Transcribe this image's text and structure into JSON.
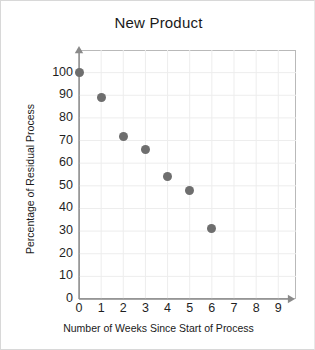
{
  "page": {
    "background_color": "#ffffff",
    "border_color": "#d8d8d8"
  },
  "chart_data": {
    "type": "scatter",
    "title": "New Product",
    "xlabel": "Number of Weeks Since Start of Process",
    "ylabel": "Percentage of Residual Process",
    "xlim": [
      0,
      9.8
    ],
    "ylim": [
      0,
      110
    ],
    "grid": true,
    "legend": null,
    "marker_color": "#6e6e6e",
    "marker_size_px": 9,
    "xticks": [
      0,
      1,
      2,
      3,
      4,
      5,
      6,
      7,
      8,
      9
    ],
    "xtick_labels": [
      "0",
      "1",
      "2",
      "3",
      "4",
      "5",
      "6",
      "7",
      "8",
      "9"
    ],
    "yticks": [
      0,
      10,
      20,
      30,
      40,
      50,
      60,
      70,
      80,
      90,
      100
    ],
    "ytick_labels": [
      "0",
      "10",
      "20",
      "30",
      "40",
      "50",
      "60",
      "70",
      "80",
      "90",
      "100"
    ],
    "x": [
      0,
      1,
      2,
      3,
      4,
      5,
      6
    ],
    "y": [
      100,
      89,
      72,
      66,
      54,
      48,
      31
    ],
    "points": [
      {
        "x": 0,
        "y": 100
      },
      {
        "x": 1,
        "y": 89
      },
      {
        "x": 2,
        "y": 72
      },
      {
        "x": 3,
        "y": 66
      },
      {
        "x": 4,
        "y": 54
      },
      {
        "x": 5,
        "y": 48
      },
      {
        "x": 6,
        "y": 31
      }
    ],
    "axis_color": "#8a8a8a",
    "grid_color": "#ededed",
    "frame_color": "#b9b9b9",
    "axis_arrows": true
  }
}
